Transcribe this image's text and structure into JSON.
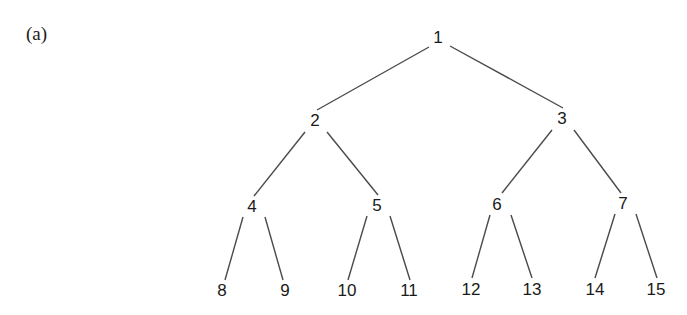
{
  "figure": {
    "panel_label": "(a)",
    "colors": {
      "edge": "#4a4a4a",
      "text": "#1a1a1a",
      "background": "#ffffff"
    }
  },
  "tree": {
    "nodes": [
      {
        "id": 1,
        "label": "1",
        "x": 438,
        "y": 37
      },
      {
        "id": 2,
        "label": "2",
        "x": 315,
        "y": 120
      },
      {
        "id": 3,
        "label": "3",
        "x": 562,
        "y": 118
      },
      {
        "id": 4,
        "label": "4",
        "x": 252,
        "y": 206
      },
      {
        "id": 5,
        "label": "5",
        "x": 377,
        "y": 205
      },
      {
        "id": 6,
        "label": "6",
        "x": 497,
        "y": 204
      },
      {
        "id": 7,
        "label": "7",
        "x": 623,
        "y": 203
      },
      {
        "id": 8,
        "label": "8",
        "x": 222,
        "y": 290
      },
      {
        "id": 9,
        "label": "9",
        "x": 285,
        "y": 290
      },
      {
        "id": 10,
        "label": "10",
        "x": 347,
        "y": 290
      },
      {
        "id": 11,
        "label": "11",
        "x": 409,
        "y": 290
      },
      {
        "id": 12,
        "label": "12",
        "x": 471,
        "y": 289
      },
      {
        "id": 13,
        "label": "13",
        "x": 532,
        "y": 289
      },
      {
        "id": 14,
        "label": "14",
        "x": 595,
        "y": 289
      },
      {
        "id": 15,
        "label": "15",
        "x": 656,
        "y": 289
      }
    ],
    "edges": [
      {
        "from": 1,
        "to": 2,
        "x1": 429,
        "y1": 47,
        "x2": 317,
        "y2": 110
      },
      {
        "from": 1,
        "to": 3,
        "x1": 450,
        "y1": 46,
        "x2": 563,
        "y2": 108
      },
      {
        "from": 2,
        "to": 4,
        "x1": 305,
        "y1": 132,
        "x2": 254,
        "y2": 196
      },
      {
        "from": 2,
        "to": 5,
        "x1": 327,
        "y1": 132,
        "x2": 378,
        "y2": 195
      },
      {
        "from": 3,
        "to": 6,
        "x1": 552,
        "y1": 130,
        "x2": 502,
        "y2": 193
      },
      {
        "from": 3,
        "to": 7,
        "x1": 574,
        "y1": 130,
        "x2": 621,
        "y2": 193
      },
      {
        "from": 4,
        "to": 8,
        "x1": 243,
        "y1": 217,
        "x2": 225,
        "y2": 280
      },
      {
        "from": 4,
        "to": 9,
        "x1": 265,
        "y1": 217,
        "x2": 283,
        "y2": 280
      },
      {
        "from": 5,
        "to": 10,
        "x1": 367,
        "y1": 216,
        "x2": 348,
        "y2": 280
      },
      {
        "from": 5,
        "to": 11,
        "x1": 390,
        "y1": 216,
        "x2": 410,
        "y2": 280
      },
      {
        "from": 6,
        "to": 12,
        "x1": 490,
        "y1": 215,
        "x2": 472,
        "y2": 278
      },
      {
        "from": 6,
        "to": 13,
        "x1": 511,
        "y1": 215,
        "x2": 532,
        "y2": 278
      },
      {
        "from": 7,
        "to": 14,
        "x1": 615,
        "y1": 214,
        "x2": 595,
        "y2": 278
      },
      {
        "from": 7,
        "to": 15,
        "x1": 636,
        "y1": 214,
        "x2": 657,
        "y2": 278
      }
    ]
  }
}
